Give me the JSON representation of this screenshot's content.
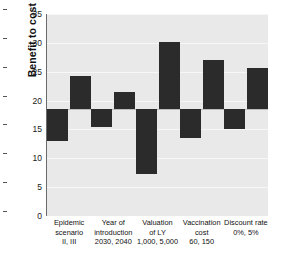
{
  "chart_data": {
    "type": "bar",
    "title": "",
    "subtitle": "",
    "xlabel": "",
    "ylabel": "Benefit to cost ratio",
    "ylim": [
      0,
      35
    ],
    "yticks": [
      0,
      5,
      10,
      15,
      20,
      25,
      30,
      35
    ],
    "grid": true,
    "legend": "none",
    "baseline": 18.5,
    "orientation": "vertical",
    "categories": [
      "Epidemic scenario",
      "Year of introduction",
      "Valuation of LY",
      "Vaccination cost",
      "Discount rate"
    ],
    "category_labels": [
      [
        "Epidemic",
        "scenario",
        "II, III"
      ],
      [
        "Year of",
        "introduction",
        "2030, 2040"
      ],
      [
        "Valuation",
        "of LY",
        "1,000, 5,000"
      ],
      [
        "Vaccination",
        "cost",
        "60, 150"
      ],
      [
        "Discount rate",
        "0%, 5%"
      ]
    ],
    "series": [
      {
        "name": "Low parameter value",
        "values": [
          13.0,
          15.5,
          7.3,
          13.5,
          15.0
        ]
      },
      {
        "name": "High parameter value",
        "values": [
          24.2,
          21.5,
          30.1,
          27.1,
          25.6
        ]
      }
    ],
    "colors": {
      "bar": "#2b2b2b",
      "plot_background": "#e9e9e9",
      "grid": "#f7f7f7",
      "baseline": "#bdbdbd",
      "axis": "#6b6b6b",
      "text": "#111111"
    }
  }
}
